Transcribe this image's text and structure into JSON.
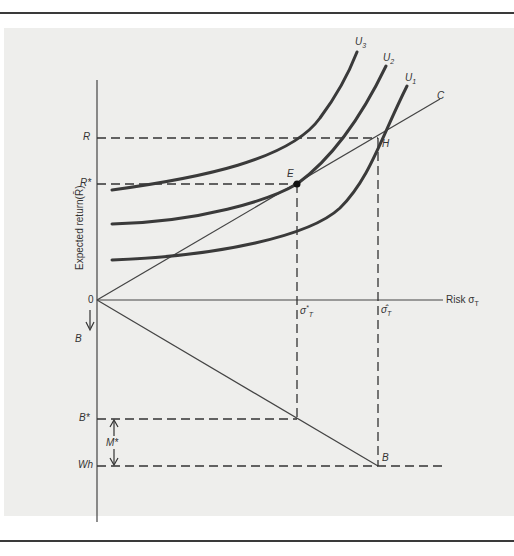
{
  "diagram": {
    "axes": {
      "y_label": "Expected return(R̄)",
      "x_label": "Risk σ",
      "x_label_sub": "T",
      "origin": "0",
      "down_label": "B"
    },
    "y_ticks": {
      "R": "R",
      "R_star": "R*",
      "B_star": "B*",
      "Wh": "Wh"
    },
    "x_ticks": {
      "sigma_star": "σ",
      "sigma_star_sub": "T",
      "sigma_star_sup": "*",
      "sigma_hat": "σ̂",
      "sigma_hat_sub": "T"
    },
    "curves": [
      {
        "name": "U",
        "sub": "3"
      },
      {
        "name": "U",
        "sub": "2"
      },
      {
        "name": "U",
        "sub": "1"
      }
    ],
    "points": {
      "E": "E",
      "H": "H",
      "C": "C",
      "B": "B",
      "M_star": "M*"
    },
    "colors": {
      "background": "#eeeeec",
      "ink": "#333333",
      "rule": "#3a3a3a"
    }
  }
}
